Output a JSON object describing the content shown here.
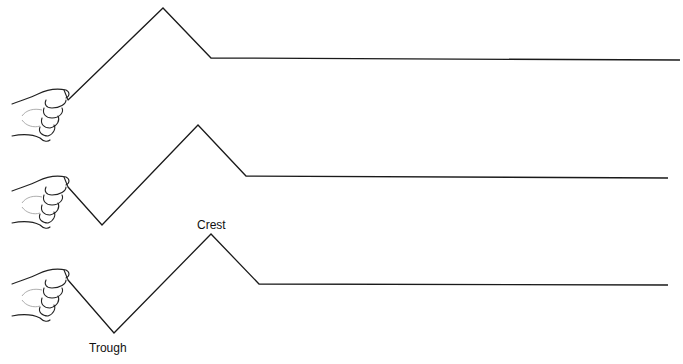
{
  "diagram": {
    "title": "",
    "labels": {
      "crest": "Crest",
      "trough": "Trough"
    },
    "waves": [
      {
        "name": "wave-1",
        "points": [
          [
            68,
            100
          ],
          [
            163,
            8
          ],
          [
            211,
            58
          ],
          [
            680,
            60
          ]
        ]
      },
      {
        "name": "wave-2",
        "points": [
          [
            68,
            187
          ],
          [
            102,
            225
          ],
          [
            198,
            125
          ],
          [
            246,
            176
          ],
          [
            668,
            178
          ]
        ]
      },
      {
        "name": "wave-3",
        "points": [
          [
            68,
            280
          ],
          [
            114,
            333
          ],
          [
            211,
            234
          ],
          [
            259,
            284
          ],
          [
            668,
            285
          ]
        ]
      }
    ],
    "hands": [
      {
        "name": "hand-1",
        "y": 100
      },
      {
        "name": "hand-2",
        "y": 187
      },
      {
        "name": "hand-3",
        "y": 280
      }
    ],
    "colors": {
      "line": "#1a1a1a",
      "background": "#ffffff"
    }
  }
}
